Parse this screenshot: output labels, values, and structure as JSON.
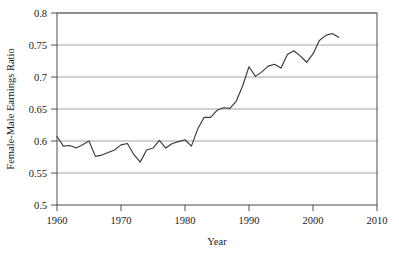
{
  "chart_data": {
    "type": "line",
    "title": "",
    "xlabel": "Year",
    "ylabel": "Female-Male Earnings Ratio",
    "xlim": [
      1960,
      2010
    ],
    "ylim": [
      0.5,
      0.8
    ],
    "xticks": [
      1960,
      1970,
      1980,
      1990,
      2000,
      2010
    ],
    "xtick_labels": [
      "1960",
      "1970",
      "1980",
      "1990",
      "2000",
      "2010"
    ],
    "yticks": [
      0.5,
      0.55,
      0.6,
      0.65,
      0.7,
      0.75,
      0.8
    ],
    "ytick_labels": [
      "0.5",
      "0.55",
      "0.6",
      "0.65",
      "0.7",
      "0.75",
      "0.8"
    ],
    "grid": "horizontal",
    "legend": "none",
    "line_color": "#3a3a3a",
    "series": [
      {
        "name": "Female-Male Earnings Ratio",
        "x": [
          1960,
          1961,
          1962,
          1963,
          1964,
          1965,
          1966,
          1967,
          1968,
          1969,
          1970,
          1971,
          1972,
          1973,
          1974,
          1975,
          1976,
          1977,
          1978,
          1979,
          1980,
          1981,
          1982,
          1983,
          1984,
          1985,
          1986,
          1987,
          1988,
          1989,
          1990,
          1991,
          1992,
          1993,
          1994,
          1995,
          1996,
          1997,
          1998,
          1999,
          2000,
          2001,
          2002,
          2003,
          2004
        ],
        "values": [
          0.607,
          0.592,
          0.593,
          0.589,
          0.594,
          0.6,
          0.576,
          0.578,
          0.582,
          0.586,
          0.594,
          0.596,
          0.579,
          0.567,
          0.586,
          0.589,
          0.601,
          0.589,
          0.596,
          0.599,
          0.602,
          0.592,
          0.619,
          0.637,
          0.637,
          0.648,
          0.652,
          0.651,
          0.662,
          0.686,
          0.716,
          0.701,
          0.708,
          0.717,
          0.72,
          0.714,
          0.735,
          0.741,
          0.733,
          0.723,
          0.736,
          0.757,
          0.765,
          0.768,
          0.762
        ]
      }
    ]
  }
}
